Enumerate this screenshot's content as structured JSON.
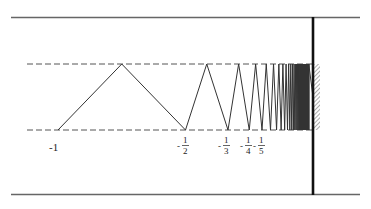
{
  "diagram": {
    "type": "zigzag-convergence",
    "colors": {
      "line": "#333333",
      "rail": "#555555",
      "wall": "#111111",
      "hatch": "#444444"
    },
    "labels": [
      {
        "id": "m1",
        "text": "-1",
        "kind": "integer"
      },
      {
        "id": "m2",
        "sign": "-",
        "num": "1",
        "den": "2",
        "kind": "fraction"
      },
      {
        "id": "m3",
        "sign": "-",
        "num": "1",
        "den": "3",
        "kind": "fraction"
      },
      {
        "id": "m4",
        "sign": "-",
        "num": "1",
        "den": "4",
        "kind": "fraction"
      },
      {
        "id": "m5",
        "sign": "-",
        "num": "1",
        "den": "5",
        "kind": "fraction"
      }
    ]
  }
}
